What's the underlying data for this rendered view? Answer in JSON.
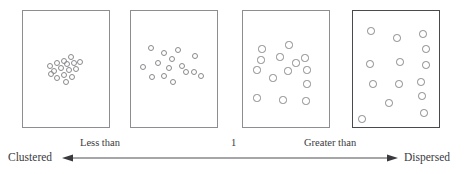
{
  "figure": {
    "background_color": "#ffffff",
    "width": 467,
    "height": 174
  },
  "axis": {
    "left_label": "Clustered",
    "right_label": "Dispersed",
    "left_mid_label": "Less than",
    "right_mid_label": "Greater than",
    "center_label": "1",
    "line_color": "#3a3a3e",
    "line_y": 158,
    "line_x_start": 62,
    "line_x_end": 398,
    "left_arrowhead": true,
    "right_arrowhead": true
  },
  "panels": [
    {
      "name": "clustered-panel",
      "index": 1,
      "pattern": "clustered",
      "x": 22,
      "y": 10,
      "width": 88,
      "height": 118,
      "border_color": "#8e8e92",
      "border_width": 1,
      "emphasis": false,
      "dot_count": 16,
      "dot_color": "#8a8a8e",
      "dots": [
        {
          "cx": 71,
          "cy": 57,
          "r": 3.4
        },
        {
          "cx": 64,
          "cy": 61,
          "r": 3.4
        },
        {
          "cx": 57,
          "cy": 63,
          "r": 3.4
        },
        {
          "cx": 50,
          "cy": 66,
          "r": 3.4
        },
        {
          "cx": 67,
          "cy": 64,
          "r": 3.4
        },
        {
          "cx": 74,
          "cy": 63,
          "r": 3.4
        },
        {
          "cx": 80,
          "cy": 62,
          "r": 3.4
        },
        {
          "cx": 61,
          "cy": 68,
          "r": 3.4
        },
        {
          "cx": 69,
          "cy": 70,
          "r": 3.4
        },
        {
          "cx": 76,
          "cy": 69,
          "r": 3.4
        },
        {
          "cx": 54,
          "cy": 71,
          "r": 3.4
        },
        {
          "cx": 64,
          "cy": 75,
          "r": 3.4
        },
        {
          "cx": 72,
          "cy": 77,
          "r": 3.4
        },
        {
          "cx": 57,
          "cy": 78,
          "r": 3.4
        },
        {
          "cx": 66,
          "cy": 82,
          "r": 3.4
        },
        {
          "cx": 51,
          "cy": 74,
          "r": 3.4
        }
      ]
    },
    {
      "name": "less-than-one-panel",
      "index": 2,
      "pattern": "moderately clustered",
      "x": 130,
      "y": 10,
      "width": 88,
      "height": 118,
      "border_color": "#8e8e92",
      "border_width": 1,
      "emphasis": false,
      "dot_count": 15,
      "dot_color": "#8a8a8e",
      "dots": [
        {
          "cx": 151,
          "cy": 48,
          "r": 3.4
        },
        {
          "cx": 164,
          "cy": 53,
          "r": 3.4
        },
        {
          "cx": 178,
          "cy": 50,
          "r": 3.4
        },
        {
          "cx": 195,
          "cy": 56,
          "r": 3.4
        },
        {
          "cx": 172,
          "cy": 59,
          "r": 3.4
        },
        {
          "cx": 158,
          "cy": 63,
          "r": 3.4
        },
        {
          "cx": 143,
          "cy": 67,
          "r": 3.4
        },
        {
          "cx": 169,
          "cy": 68,
          "r": 3.4
        },
        {
          "cx": 182,
          "cy": 66,
          "r": 3.4
        },
        {
          "cx": 186,
          "cy": 72,
          "r": 3.4
        },
        {
          "cx": 194,
          "cy": 72,
          "r": 3.4
        },
        {
          "cx": 201,
          "cy": 76,
          "r": 3.4
        },
        {
          "cx": 152,
          "cy": 77,
          "r": 3.4
        },
        {
          "cx": 164,
          "cy": 76,
          "r": 3.4
        },
        {
          "cx": 173,
          "cy": 82,
          "r": 3.4
        }
      ]
    },
    {
      "name": "random-panel",
      "index": 3,
      "pattern": "random",
      "x": 242,
      "y": 10,
      "width": 88,
      "height": 118,
      "border_color": "#8e8e92",
      "border_width": 1,
      "emphasis": false,
      "dot_count": 14,
      "dot_color": "#8a8a8e",
      "dots": [
        {
          "cx": 289,
          "cy": 45,
          "r": 3.6
        },
        {
          "cx": 262,
          "cy": 49,
          "r": 3.6
        },
        {
          "cx": 280,
          "cy": 57,
          "r": 3.6
        },
        {
          "cx": 305,
          "cy": 58,
          "r": 3.6
        },
        {
          "cx": 261,
          "cy": 60,
          "r": 3.6
        },
        {
          "cx": 257,
          "cy": 70,
          "r": 3.6
        },
        {
          "cx": 288,
          "cy": 71,
          "r": 3.6
        },
        {
          "cx": 307,
          "cy": 70,
          "r": 3.6
        },
        {
          "cx": 273,
          "cy": 78,
          "r": 3.6
        },
        {
          "cx": 307,
          "cy": 84,
          "r": 3.6
        },
        {
          "cx": 257,
          "cy": 98,
          "r": 3.6
        },
        {
          "cx": 283,
          "cy": 100,
          "r": 3.6
        },
        {
          "cx": 306,
          "cy": 101,
          "r": 3.6
        },
        {
          "cx": 296,
          "cy": 63,
          "r": 3.6
        }
      ]
    },
    {
      "name": "dispersed-panel",
      "index": 4,
      "pattern": "dispersed",
      "x": 352,
      "y": 10,
      "width": 88,
      "height": 118,
      "border_color": "#4a4a4e",
      "border_width": 1.4,
      "emphasis": true,
      "dot_count": 14,
      "dot_color": "#8a8a8e",
      "dots": [
        {
          "cx": 371,
          "cy": 31,
          "r": 3.8
        },
        {
          "cx": 397,
          "cy": 38,
          "r": 3.8
        },
        {
          "cx": 423,
          "cy": 34,
          "r": 3.8
        },
        {
          "cx": 370,
          "cy": 64,
          "r": 3.8
        },
        {
          "cx": 400,
          "cy": 62,
          "r": 3.8
        },
        {
          "cx": 426,
          "cy": 65,
          "r": 3.8
        },
        {
          "cx": 373,
          "cy": 84,
          "r": 3.8
        },
        {
          "cx": 399,
          "cy": 84,
          "r": 3.8
        },
        {
          "cx": 421,
          "cy": 82,
          "r": 3.8
        },
        {
          "cx": 422,
          "cy": 96,
          "r": 3.8
        },
        {
          "cx": 389,
          "cy": 103,
          "r": 3.8
        },
        {
          "cx": 424,
          "cy": 113,
          "r": 3.8
        },
        {
          "cx": 362,
          "cy": 119,
          "r": 3.8
        },
        {
          "cx": 426,
          "cy": 49,
          "r": 3.8
        }
      ]
    }
  ]
}
